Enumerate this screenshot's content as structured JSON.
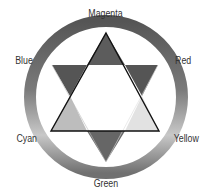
{
  "diagram": {
    "type": "color-wheel",
    "labels": {
      "top": "Magenta",
      "top_right": "Red",
      "top_left": "Blue",
      "bottom_left": "Cyan",
      "bottom_right": "Yellow",
      "bottom": "Green"
    },
    "colors": {
      "ring_top": "#5a5a5a",
      "ring_side": "#808080",
      "ring_lower_side": "#c4c4c4",
      "ring_bottom": "#777777",
      "segment_top": "#5c5c5c",
      "segment_top_left": "#555555",
      "segment_top_right": "#555555",
      "segment_bottom_left": "#bdbdbd",
      "segment_bottom_right": "#e2e2e2",
      "segment_bottom": "#666666",
      "outline": "#111111"
    }
  }
}
